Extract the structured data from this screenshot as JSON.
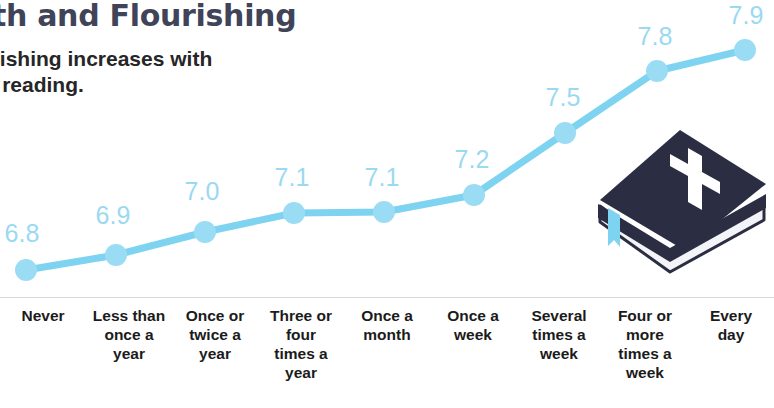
{
  "header": {
    "title": "aith and Flourishing",
    "subtitle": "ourishing increases with\nble reading."
  },
  "illustration": {
    "name": "bible-illustration",
    "cover_color": "#2b2d42",
    "cross_color": "#ffffff",
    "pages_color": "#f2f4f7",
    "ribbon_color": "#7dd3f0"
  },
  "colors": {
    "line": "#7dd3f0",
    "marker": "#9bdcf5",
    "value_label": "#9ad9f2",
    "title": "#3f4458",
    "subtitle": "#262626",
    "axis_label": "#1b1b1b",
    "background": "#ffffff"
  },
  "chart_data": {
    "type": "line",
    "title": "aith and Flourishing",
    "subtitle": "ourishing increases with ble reading.",
    "xlabel": "",
    "ylabel": "",
    "ylim": [
      6.6,
      8.05
    ],
    "grid": false,
    "legend": false,
    "categories": [
      "Never",
      "Less than once a year",
      "Once or twice a year",
      "Three or four times a year",
      "Once a month",
      "Once a week",
      "Several times a week",
      "Four or more times a week",
      "Every day"
    ],
    "category_lines": [
      [
        "Never"
      ],
      [
        "Less than",
        "once a",
        "year"
      ],
      [
        "Once or",
        "twice a",
        "year"
      ],
      [
        "Three or",
        "four",
        "times a",
        "year"
      ],
      [
        "Once a",
        "month"
      ],
      [
        "Once a",
        "week"
      ],
      [
        "Several",
        "times a",
        "week"
      ],
      [
        "Four or",
        "more",
        "times a",
        "week"
      ],
      [
        "Every",
        "day"
      ]
    ],
    "values": [
      6.8,
      6.9,
      7.0,
      7.1,
      7.1,
      7.2,
      7.5,
      7.8,
      7.9
    ],
    "value_labels": [
      "6.8",
      "6.9",
      "7.0",
      "7.1",
      "7.1",
      "7.2",
      "7.5",
      "7.8",
      "7.9"
    ],
    "points_px": [
      {
        "x": 26,
        "y": 270
      },
      {
        "x": 116,
        "y": 255
      },
      {
        "x": 205,
        "y": 232
      },
      {
        "x": 294,
        "y": 213
      },
      {
        "x": 384,
        "y": 212
      },
      {
        "x": 474,
        "y": 195
      },
      {
        "x": 565,
        "y": 133
      },
      {
        "x": 657,
        "y": 71
      },
      {
        "x": 745,
        "y": 50
      }
    ],
    "label_offsets_px": [
      {
        "x": 22,
        "y": 246
      },
      {
        "x": 113,
        "y": 228
      },
      {
        "x": 202,
        "y": 204
      },
      {
        "x": 292,
        "y": 190
      },
      {
        "x": 382,
        "y": 190
      },
      {
        "x": 472,
        "y": 172
      },
      {
        "x": 563,
        "y": 110
      },
      {
        "x": 655,
        "y": 49
      },
      {
        "x": 746,
        "y": 28
      }
    ]
  }
}
